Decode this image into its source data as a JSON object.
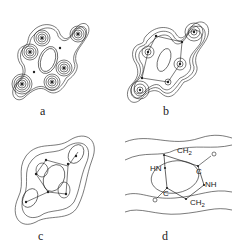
{
  "figure": {
    "panels": [
      {
        "id": "a",
        "label": "a",
        "contour_style": "dense (many contour levels)"
      },
      {
        "id": "b",
        "label": "b",
        "contour_style": "medium contour levels"
      },
      {
        "id": "c",
        "label": "c",
        "contour_style": "sparse contour levels"
      },
      {
        "id": "d",
        "label": "d",
        "contour_style": "structural diagram with outer contours",
        "atoms": {
          "ch2_top": "CH",
          "ch2_top_sub": "2",
          "c_right": "C",
          "o_right": "O",
          "nh_right": "NH",
          "hn_left": "HN",
          "c_left": "C",
          "o_left": "O",
          "ch2_bottom": "CH",
          "ch2_bottom_sub": "2"
        }
      }
    ]
  },
  "colors": {
    "line": "#222222",
    "background": "#ffffff"
  }
}
